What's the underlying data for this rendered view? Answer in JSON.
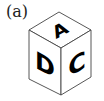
{
  "figure": {
    "label": "(a)",
    "type": "isometric cube",
    "faces": {
      "top": "A",
      "left": "D",
      "right": "C"
    },
    "colors": {
      "edge": "#444444",
      "face": "#ffffff",
      "letter": "#000000"
    }
  }
}
